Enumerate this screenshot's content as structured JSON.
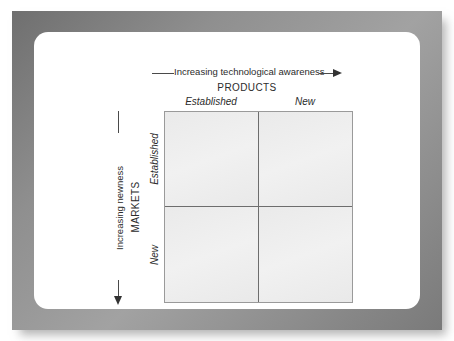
{
  "figure": {
    "type": "matrix-2x2",
    "horizontal_axis": {
      "label": "Increasing technological awareness",
      "direction": "right",
      "arrow_icon": "arrow-right-icon"
    },
    "vertical_axis": {
      "label": "Increasing newness",
      "direction": "down",
      "arrow_icon": "arrow-down-icon"
    },
    "columns": {
      "title": "PRODUCTS",
      "headers": [
        "Established",
        "New"
      ]
    },
    "rows": {
      "title": "MARKETS",
      "headers": [
        "Established",
        "New"
      ]
    },
    "cells": [
      {
        "id": "established-products-established-markets",
        "label": ""
      },
      {
        "id": "new-products-established-markets",
        "label": ""
      },
      {
        "id": "established-products-new-markets",
        "label": ""
      },
      {
        "id": "new-products-new-markets",
        "label": ""
      }
    ],
    "colors": {
      "frame": "#8f8f8f",
      "panel": "#ffffff",
      "cell_fill": "#eeeeee",
      "cell_border": "#6d6d6d",
      "matrix_border": "#9a9a9a",
      "text": "#2b2b2b",
      "arrow": "#333333"
    }
  }
}
